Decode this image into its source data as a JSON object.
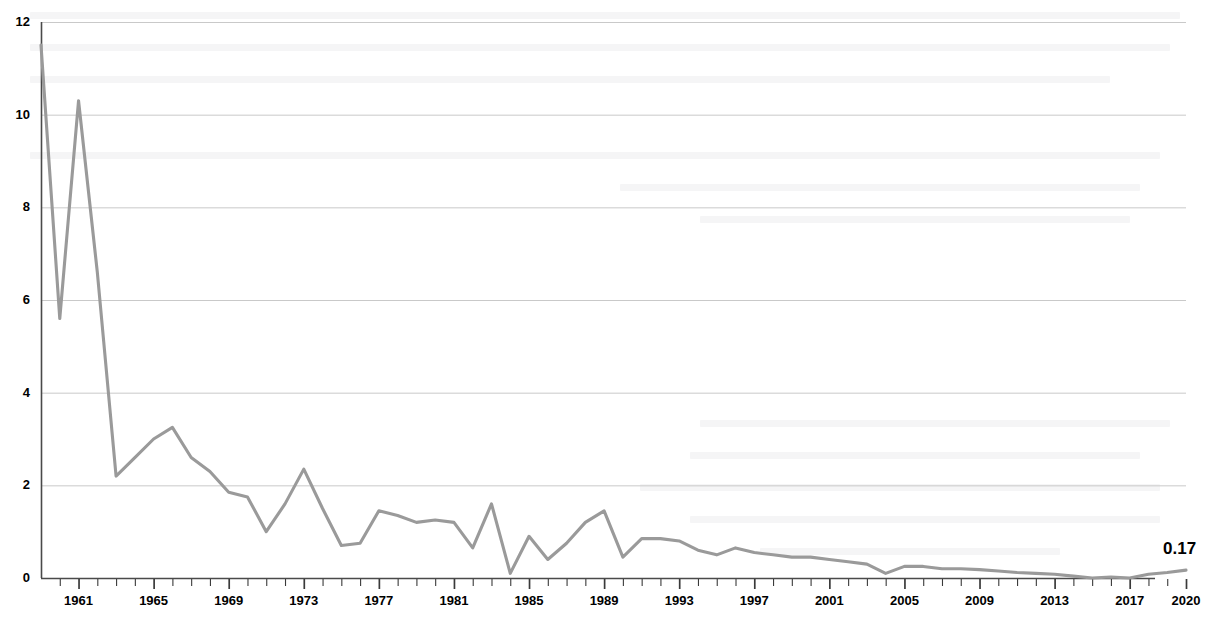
{
  "chart_data": {
    "type": "line",
    "title": "",
    "subtitle": "",
    "xlabel": "",
    "ylabel": "",
    "grid": true,
    "legend": false,
    "legend_position": "none",
    "line_color": "#9a9a9a",
    "gridline_color": "#c9c9c9",
    "axis_color": "#4a4a4a",
    "xlim": [
      1959,
      2020
    ],
    "ylim": [
      0,
      12
    ],
    "yticks": [
      0,
      2,
      4,
      6,
      8,
      10,
      12
    ],
    "ytick_labels": [
      "0",
      "2",
      "4",
      "6",
      "8",
      "10",
      "12"
    ],
    "xtick_labels": [
      "1961",
      "1965",
      "1969",
      "1973",
      "1977",
      "1981",
      "1985",
      "1989",
      "1993",
      "1997",
      "2001",
      "2005",
      "2009",
      "2013",
      "2017",
      "2020"
    ],
    "xtick_years": [
      1961,
      1965,
      1969,
      1973,
      1977,
      1981,
      1985,
      1989,
      1993,
      1997,
      2001,
      2005,
      2009,
      2013,
      2017,
      2020
    ],
    "minor_tick_interval": 1,
    "x": [
      1959,
      1960,
      1961,
      1962,
      1963,
      1964,
      1965,
      1966,
      1967,
      1968,
      1969,
      1970,
      1971,
      1972,
      1973,
      1974,
      1975,
      1976,
      1977,
      1978,
      1979,
      1980,
      1981,
      1982,
      1983,
      1984,
      1985,
      1986,
      1987,
      1988,
      1989,
      1990,
      1991,
      1992,
      1993,
      1994,
      1995,
      1996,
      1997,
      1998,
      1999,
      2000,
      2001,
      2002,
      2003,
      2004,
      2005,
      2006,
      2007,
      2008,
      2009,
      2010,
      2011,
      2012,
      2013,
      2014,
      2015,
      2016,
      2017,
      2018,
      2019,
      2020
    ],
    "values": [
      11.5,
      5.6,
      10.3,
      6.6,
      2.2,
      2.6,
      3.0,
      3.25,
      2.6,
      2.3,
      1.85,
      1.75,
      1.0,
      1.6,
      2.35,
      1.5,
      0.7,
      0.75,
      1.45,
      1.35,
      1.2,
      1.25,
      1.2,
      0.65,
      1.6,
      0.1,
      0.9,
      0.4,
      0.75,
      1.2,
      1.45,
      0.45,
      0.85,
      0.85,
      0.8,
      0.6,
      0.5,
      0.65,
      0.55,
      0.5,
      0.45,
      0.45,
      0.4,
      0.35,
      0.3,
      0.1,
      0.25,
      0.25,
      0.2,
      0.2,
      0.18,
      0.15,
      0.12,
      0.1,
      0.08,
      0.04,
      0.0,
      0.02,
      0.0,
      0.08,
      0.12,
      0.17
    ],
    "end_value_label": "0.17",
    "end_value": 0.17
  },
  "axis": {
    "y_axis_name": "value-axis",
    "x_axis_name": "year-axis"
  }
}
